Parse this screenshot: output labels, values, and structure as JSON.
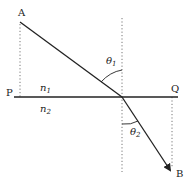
{
  "diagram": {
    "points": {
      "A": {
        "label": "A",
        "x": 20,
        "y": 22
      },
      "B": {
        "label": "B",
        "x": 172,
        "y": 172
      },
      "P": {
        "label": "P",
        "x": 14,
        "y": 97
      },
      "Q": {
        "label": "Q",
        "x": 178,
        "y": 97
      },
      "O": {
        "x": 122,
        "y": 97
      }
    },
    "media": {
      "upper": {
        "label": "n",
        "sub": "1"
      },
      "lower": {
        "label": "n",
        "sub": "2"
      }
    },
    "angles": {
      "incidence": {
        "label": "θ",
        "sub": "1"
      },
      "refraction": {
        "label": "θ",
        "sub": "2"
      }
    },
    "colors": {
      "line": "#222222",
      "dotted": "#777777"
    }
  }
}
